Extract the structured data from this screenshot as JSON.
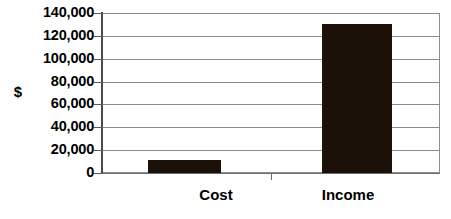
{
  "chart_data": {
    "type": "bar",
    "title": "",
    "subtitle": "",
    "xlabel": "",
    "ylabel": "$",
    "categories": [
      "Cost",
      "Income"
    ],
    "values": [
      11000,
      130000
    ],
    "series": [
      {
        "name": "",
        "values": [
          11000,
          130000
        ]
      }
    ],
    "ylim": [
      0,
      140000
    ],
    "ytick_values": [
      140000,
      120000,
      100000,
      80000,
      60000,
      40000,
      20000,
      0
    ],
    "ytick_labels": [
      "140,000",
      "120,000",
      "100,000",
      "80,000",
      "60,000",
      "40,000",
      "20,000",
      "0"
    ],
    "grid": true,
    "grid_axis": "y",
    "legend": false,
    "legend_position": "none",
    "bar_color": "#1b1109",
    "grid_color": "#8a8a8a",
    "axis_color": "#4a4a4a",
    "background_color": "#ffffff",
    "text_color": "#000000",
    "annotations": []
  },
  "chart": {
    "axis_title_y": "$",
    "y_ticks": [
      {
        "label": "140,000",
        "value": 140000
      },
      {
        "label": "120,000",
        "value": 120000
      },
      {
        "label": "100,000",
        "value": 100000
      },
      {
        "label": "80,000",
        "value": 80000
      },
      {
        "label": "60,000",
        "value": 60000
      },
      {
        "label": "40,000",
        "value": 40000
      },
      {
        "label": "20,000",
        "value": 20000
      },
      {
        "label": "0",
        "value": 0
      }
    ],
    "bars": [
      {
        "label": "Cost",
        "value": 11000
      },
      {
        "label": "Income",
        "value": 130000
      }
    ]
  }
}
